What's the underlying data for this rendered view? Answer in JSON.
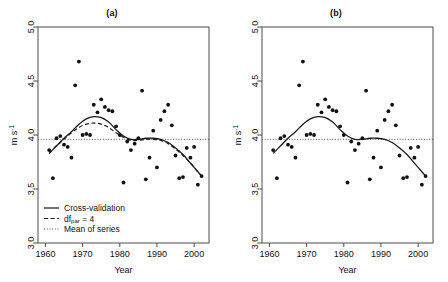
{
  "figure": {
    "background": "#ffffff",
    "point_color": "#111111",
    "line_color": "#1a1a1a",
    "mean_color": "#555555"
  },
  "panels": [
    {
      "id": "panel-a",
      "title": "(a)",
      "has_legend": true,
      "legend": {
        "items": [
          {
            "label": "Cross-validation",
            "style": "solid"
          },
          {
            "label_main": "df",
            "label_sub": "par",
            "label_tail": " = 4",
            "style": "dashed"
          },
          {
            "label": "Mean of series",
            "style": "dotted"
          }
        ]
      }
    },
    {
      "id": "panel-b",
      "title": "(b)",
      "has_legend": false,
      "legend": {
        "items": []
      }
    }
  ],
  "chart_data": {
    "type": "scatter",
    "title": "",
    "subtitle": "",
    "xlabel": "Year",
    "ylabel": "m s-1",
    "ylabel_display": "m s",
    "ylabel_exponent": "-1",
    "xlim": [
      1958,
      2004
    ],
    "ylim": [
      3.0,
      5.0
    ],
    "xticks": [
      1960,
      1970,
      1980,
      1990,
      2000
    ],
    "xticklabels": [
      "1960",
      "1970",
      "1980",
      "1990",
      "2000"
    ],
    "yticks": [
      3.0,
      3.5,
      4.0,
      4.5,
      5.0
    ],
    "yticklabels": [
      "3.0",
      "3.5",
      "4.0",
      "4.5",
      "5.0"
    ],
    "grid": false,
    "legend_position": "bottom-left (panel a only)",
    "x": [
      1961,
      1962,
      1963,
      1964,
      1965,
      1966,
      1967,
      1968,
      1969,
      1970,
      1971,
      1972,
      1973,
      1974,
      1975,
      1976,
      1977,
      1978,
      1979,
      1980,
      1981,
      1982,
      1983,
      1984,
      1985,
      1986,
      1987,
      1988,
      1989,
      1990,
      1991,
      1992,
      1993,
      1994,
      1995,
      1996,
      1997,
      1998,
      1999,
      2000,
      2001,
      2002
    ],
    "y": [
      3.86,
      3.6,
      3.97,
      3.99,
      3.91,
      3.89,
      3.79,
      4.46,
      4.68,
      4.0,
      4.01,
      4.0,
      4.28,
      4.21,
      4.33,
      4.26,
      4.23,
      4.22,
      4.08,
      4.0,
      3.56,
      3.94,
      3.86,
      3.92,
      3.97,
      4.41,
      3.59,
      3.79,
      4.04,
      3.7,
      4.14,
      4.22,
      4.28,
      4.09,
      3.81,
      3.6,
      3.61,
      3.88,
      3.79,
      3.89,
      3.54,
      3.62
    ],
    "series": [
      {
        "name": "Cross-validation",
        "style": "solid",
        "panels": [
          "a",
          "b"
        ],
        "x": [
          1961,
          1963,
          1965,
          1967,
          1969,
          1971,
          1973,
          1975,
          1977,
          1979,
          1981,
          1983,
          1985,
          1987,
          1989,
          1991,
          1993,
          1995,
          1997,
          1999,
          2001,
          2002
        ],
        "values": [
          3.83,
          3.9,
          3.97,
          4.03,
          4.1,
          4.15,
          4.17,
          4.16,
          4.12,
          4.05,
          3.99,
          3.96,
          3.96,
          3.97,
          3.97,
          3.96,
          3.93,
          3.88,
          3.82,
          3.74,
          3.66,
          3.62
        ]
      },
      {
        "name": "df_par = 4",
        "style": "dashed",
        "panels": [
          "a"
        ],
        "x": [
          1961,
          1963,
          1965,
          1967,
          1969,
          1971,
          1973,
          1975,
          1977,
          1979,
          1981,
          1983,
          1985,
          1987,
          1989,
          1991,
          1993,
          1995,
          1997,
          1999,
          2001,
          2002
        ],
        "values": [
          3.83,
          3.9,
          3.96,
          4.02,
          4.07,
          4.1,
          4.11,
          4.1,
          4.07,
          4.02,
          3.98,
          3.95,
          3.95,
          3.96,
          3.96,
          3.95,
          3.92,
          3.87,
          3.81,
          3.74,
          3.66,
          3.62
        ]
      },
      {
        "name": "Mean of series",
        "style": "dotted",
        "panels": [
          "a",
          "b"
        ],
        "value": 3.96
      }
    ]
  }
}
